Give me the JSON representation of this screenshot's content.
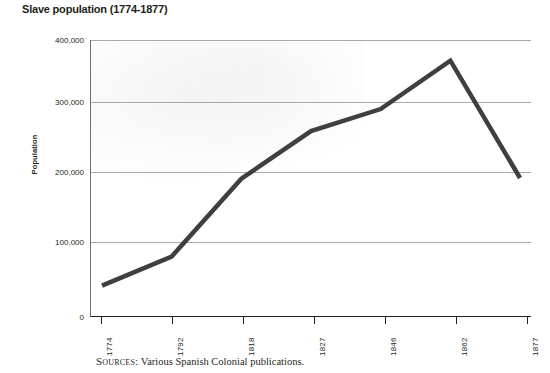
{
  "title": "Slave population (1774-1877)",
  "source": {
    "label": "Sources:",
    "text": "Various Spanish Colonial publications."
  },
  "axes": {
    "y_title": "Population",
    "y_ticks": [
      "400,000",
      "300,000",
      "200,000",
      "100,000",
      "0"
    ],
    "x_ticks": [
      "1774",
      "1792",
      "1818",
      "1827",
      "1846",
      "1862",
      "1877"
    ]
  },
  "style": {
    "line_color": "#3f3f3f",
    "grid_color": "#a7a9ac",
    "axis_color": "#231f20",
    "text_color": "#231f20",
    "plot_background": "#ffffff"
  },
  "chart_data": {
    "type": "line",
    "title": "Slave population (1774-1877)",
    "xlabel": "",
    "ylabel": "Population",
    "categories": [
      "1774",
      "1792",
      "1818",
      "1827",
      "1846",
      "1862",
      "1877"
    ],
    "values": [
      44000,
      86000,
      199000,
      268000,
      300000,
      370000,
      200000
    ],
    "ylim": [
      0,
      400000
    ],
    "yticks": [
      0,
      100000,
      200000,
      300000,
      400000
    ],
    "grid": "horizontal",
    "legend": "none",
    "series": [
      {
        "name": "Slave population",
        "values": [
          44000,
          86000,
          199000,
          268000,
          300000,
          370000,
          200000
        ]
      }
    ],
    "annotations": [
      "Sources: Various Spanish Colonial publications."
    ]
  }
}
